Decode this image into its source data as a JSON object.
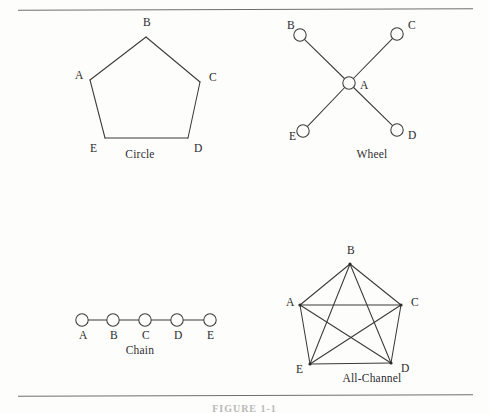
{
  "page": {
    "background_color": "#fdfdfc",
    "line_color": "#3a3a3a",
    "rule_color": "#6f6f6f",
    "clipped_caption": "FIGURE 1-1"
  },
  "networks": [
    {
      "id": "circle",
      "caption": "Circle",
      "type": "ring",
      "node_style": "none",
      "nodes": [
        {
          "label": "A",
          "x": 50,
          "y": 60
        },
        {
          "label": "B",
          "x": 106,
          "y": 17
        },
        {
          "label": "C",
          "x": 160,
          "y": 62
        },
        {
          "label": "D",
          "x": 148,
          "y": 118
        },
        {
          "label": "E",
          "x": 65,
          "y": 118
        }
      ],
      "edges": [
        [
          "A",
          "B"
        ],
        [
          "B",
          "C"
        ],
        [
          "C",
          "D"
        ],
        [
          "D",
          "E"
        ],
        [
          "E",
          "A"
        ]
      ]
    },
    {
      "id": "wheel",
      "caption": "Wheel",
      "type": "star",
      "node_style": "circle",
      "nodes": [
        {
          "label": "A",
          "x": 77,
          "y": 67
        },
        {
          "label": "B",
          "x": 28,
          "y": 19
        },
        {
          "label": "C",
          "x": 125,
          "y": 18
        },
        {
          "label": "D",
          "x": 125,
          "y": 114
        },
        {
          "label": "E",
          "x": 31,
          "y": 115
        }
      ],
      "edges": [
        [
          "A",
          "B"
        ],
        [
          "A",
          "C"
        ],
        [
          "A",
          "D"
        ],
        [
          "A",
          "E"
        ]
      ]
    },
    {
      "id": "chain",
      "caption": "Chain",
      "type": "line",
      "node_style": "circle",
      "nodes": [
        {
          "label": "A",
          "x": 42,
          "y": 24
        },
        {
          "label": "B",
          "x": 73,
          "y": 24
        },
        {
          "label": "C",
          "x": 105,
          "y": 24
        },
        {
          "label": "D",
          "x": 137,
          "y": 24
        },
        {
          "label": "E",
          "x": 170,
          "y": 24
        }
      ],
      "edges": [
        [
          "A",
          "B"
        ],
        [
          "B",
          "C"
        ],
        [
          "C",
          "D"
        ],
        [
          "D",
          "E"
        ]
      ]
    },
    {
      "id": "allchannel",
      "caption": "All-Channel",
      "type": "complete",
      "node_style": "dot",
      "nodes": [
        {
          "label": "A",
          "x": 28,
          "y": 57
        },
        {
          "label": "B",
          "x": 78,
          "y": 16
        },
        {
          "label": "C",
          "x": 129,
          "y": 57
        },
        {
          "label": "D",
          "x": 119,
          "y": 115
        },
        {
          "label": "E",
          "x": 38,
          "y": 116
        }
      ],
      "edges": [
        [
          "A",
          "B"
        ],
        [
          "B",
          "C"
        ],
        [
          "C",
          "D"
        ],
        [
          "D",
          "E"
        ],
        [
          "E",
          "A"
        ],
        [
          "A",
          "C"
        ],
        [
          "A",
          "D"
        ],
        [
          "B",
          "D"
        ],
        [
          "B",
          "E"
        ],
        [
          "C",
          "E"
        ]
      ]
    }
  ]
}
